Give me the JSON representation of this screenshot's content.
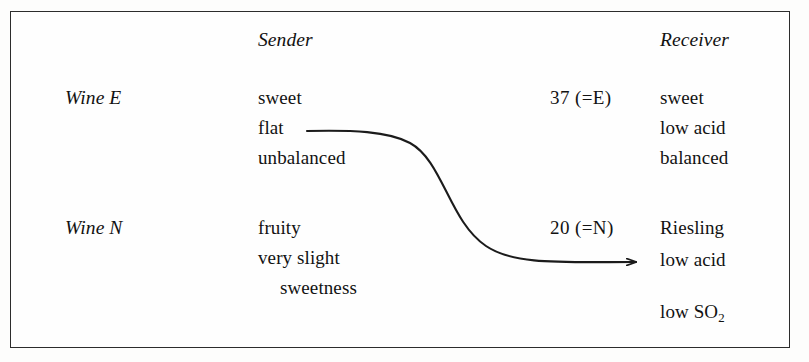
{
  "figure": {
    "columns": {
      "sender_header": "Sender",
      "receiver_header": "Receiver"
    },
    "rows": [
      {
        "label": "Wine E",
        "sender_lines": [
          "sweet",
          "flat",
          "unbalanced"
        ],
        "code": "37 (=E)",
        "receiver_lines": [
          "sweet",
          "low acid",
          "balanced"
        ]
      },
      {
        "label": "Wine N",
        "sender_lines": [
          "fruity",
          "very slight",
          "sweetness"
        ],
        "code": "20 (=N)",
        "receiver_lines": [
          "Riesling",
          "low acid"
        ],
        "receiver_extra_prefix": "low SO",
        "receiver_extra_sub": "2"
      }
    ],
    "connector": {
      "name": "flat-to-low-acid-arrow",
      "from_label": "flat",
      "to_label": "low acid",
      "color": "#1b1b1b"
    }
  }
}
